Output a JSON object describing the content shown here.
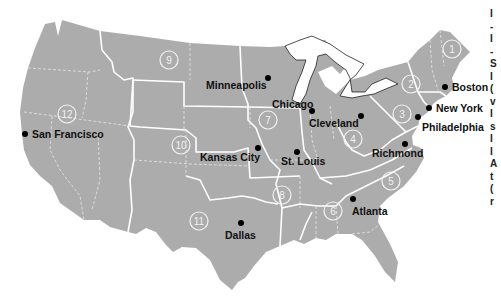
{
  "map": {
    "title": "Federal Reserve Districts",
    "colors": {
      "land": "#acacac",
      "boundary": "#ffffff",
      "dot": "#000000",
      "label": "#111111"
    },
    "districts": [
      {
        "number": "1",
        "x": 452,
        "y": 49
      },
      {
        "number": "2",
        "x": 411,
        "y": 84
      },
      {
        "number": "3",
        "x": 402,
        "y": 114
      },
      {
        "number": "4",
        "x": 353,
        "y": 139
      },
      {
        "number": "5",
        "x": 391,
        "y": 181
      },
      {
        "number": "6",
        "x": 333,
        "y": 211
      },
      {
        "number": "7",
        "x": 268,
        "y": 120
      },
      {
        "number": "8",
        "x": 282,
        "y": 195
      },
      {
        "number": "9",
        "x": 169,
        "y": 60
      },
      {
        "number": "10",
        "x": 181,
        "y": 145
      },
      {
        "number": "11",
        "x": 199,
        "y": 221
      },
      {
        "number": "12",
        "x": 67,
        "y": 114
      }
    ],
    "cities": [
      {
        "name": "Boston",
        "dot_x": 445,
        "dot_y": 87,
        "label_x": 452,
        "label_y": 91
      },
      {
        "name": "New York",
        "dot_x": 429,
        "dot_y": 108,
        "label_x": 436,
        "label_y": 112
      },
      {
        "name": "Philadelphia",
        "dot_x": 418,
        "dot_y": 117,
        "label_x": 422,
        "label_y": 131
      },
      {
        "name": "Cleveland",
        "dot_x": 361,
        "dot_y": 116,
        "label_x": 309,
        "label_y": 127
      },
      {
        "name": "Richmond",
        "dot_x": 405,
        "dot_y": 144,
        "label_x": 372,
        "label_y": 157
      },
      {
        "name": "Atlanta",
        "dot_x": 353,
        "dot_y": 199,
        "label_x": 352,
        "label_y": 215
      },
      {
        "name": "Chicago",
        "dot_x": 312,
        "dot_y": 111,
        "label_x": 272,
        "label_y": 108
      },
      {
        "name": "St. Louis",
        "dot_x": 297,
        "dot_y": 152,
        "label_x": 281,
        "label_y": 165
      },
      {
        "name": "Minneapolis",
        "dot_x": 268,
        "dot_y": 78,
        "label_x": 206,
        "label_y": 89
      },
      {
        "name": "Kansas City",
        "dot_x": 258,
        "dot_y": 148,
        "label_x": 200,
        "label_y": 161
      },
      {
        "name": "Dallas",
        "dot_x": 241,
        "dot_y": 223,
        "label_x": 225,
        "label_y": 239
      },
      {
        "name": "San Francisco",
        "dot_x": 25,
        "dot_y": 134,
        "label_x": 32,
        "label_y": 138
      }
    ]
  },
  "edge_text": {
    "lines": [
      "I",
      "-",
      "I",
      "-",
      "S",
      "I",
      "(",
      "v",
      "I",
      "s",
      "I",
      "I",
      "A",
      "t",
      "(",
      "r"
    ]
  }
}
